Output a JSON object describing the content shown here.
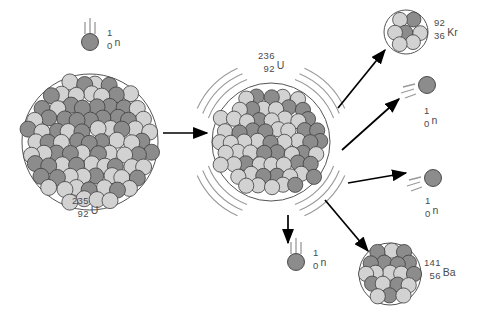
{
  "figure": {
    "width": 483,
    "height": 310,
    "background": "#ffffff"
  },
  "palette": {
    "proton_fill": "#8c8c8c",
    "neutron_fill": "#d2d2d2",
    "sphere_stroke": "#3d3d3d",
    "nucleus_outline": "#555555",
    "arrow_color": "#000000",
    "label_color": "#4a4a4a",
    "motion_line_color": "#9a9a9a"
  },
  "particles": {
    "incoming_neutron": {
      "name": "neutron",
      "mass_number": "1",
      "atomic_number": "0",
      "symbol": "n",
      "label_x": 107,
      "label_y": 28,
      "sphere_cx": 90,
      "sphere_cy": 42,
      "sphere_r": 8.5,
      "motion": "down"
    },
    "emitted_neutron_top_right": {
      "name": "neutron",
      "mass_number": "1",
      "atomic_number": "0",
      "symbol": "n",
      "label_x": 424,
      "label_y": 106,
      "sphere_cx": 427,
      "sphere_cy": 85,
      "sphere_r": 8.5,
      "motion": "up-right"
    },
    "emitted_neutron_mid_right": {
      "name": "neutron",
      "mass_number": "1",
      "atomic_number": "0",
      "symbol": "n",
      "label_x": 425,
      "label_y": 196,
      "sphere_cx": 433,
      "sphere_cy": 178,
      "sphere_r": 8.5,
      "motion": "up-right"
    },
    "emitted_neutron_bottom": {
      "name": "neutron",
      "mass_number": "1",
      "atomic_number": "0",
      "symbol": "n",
      "label_x": 313,
      "label_y": 248,
      "sphere_cx": 296,
      "sphere_cy": 262,
      "sphere_r": 8.5,
      "motion": "down"
    }
  },
  "nuclei": {
    "uranium_235": {
      "name": "uranium-235",
      "mass_number": "235",
      "atomic_number": "92",
      "symbol": "U",
      "cx": 90,
      "cy": 142,
      "r": 68,
      "label_x": 72,
      "label_y": 196,
      "excited": false
    },
    "uranium_236": {
      "name": "uranium-236 (excited compound nucleus)",
      "mass_number": "236",
      "atomic_number": "92",
      "symbol": "U",
      "cx": 271,
      "cy": 142,
      "r": 59,
      "label_x": 258,
      "label_y": 51,
      "excited": true
    },
    "krypton_92": {
      "name": "krypton-92",
      "mass_number": "92",
      "atomic_number": "36",
      "symbol": "Kr",
      "cx": 406,
      "cy": 32,
      "r": 22,
      "label_x": 434,
      "label_y": 18,
      "excited": false
    },
    "barium_141": {
      "name": "barium-141",
      "mass_number": "141",
      "atomic_number": "56",
      "symbol": "Ba",
      "cx": 390,
      "cy": 274,
      "r": 31,
      "label_x": 424,
      "label_y": 258,
      "excited": false
    }
  },
  "arrows": [
    {
      "name": "reaction-arrow-main",
      "x1": 163,
      "y1": 133,
      "x2": 207,
      "y2": 133
    },
    {
      "name": "arrow-to-krypton",
      "x1": 338,
      "y1": 108,
      "x2": 385,
      "y2": 50
    },
    {
      "name": "arrow-to-neutron-top-right",
      "x1": 342,
      "y1": 150,
      "x2": 399,
      "y2": 99
    },
    {
      "name": "arrow-to-neutron-mid-right",
      "x1": 348,
      "y1": 183,
      "x2": 406,
      "y2": 173
    },
    {
      "name": "arrow-to-neutron-bottom",
      "x1": 288,
      "y1": 215,
      "x2": 288,
      "y2": 243
    },
    {
      "name": "arrow-to-barium",
      "x1": 325,
      "y1": 200,
      "x2": 368,
      "y2": 251
    }
  ]
}
